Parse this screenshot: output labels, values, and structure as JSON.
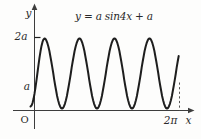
{
  "labels": {
    "title": "y = a sin4x + a",
    "y_axis": "y",
    "x_axis": "x",
    "origin": "O",
    "two_a": "2a",
    "a": "a",
    "two_pi": "2π"
  },
  "colors": {
    "background": "#fdfdfc",
    "curve": "#1e1e1e",
    "axis": "#3d3d3d",
    "text": "#2a2a2a",
    "dashed_guide": "#555555"
  },
  "chart_data": {
    "type": "line",
    "title": "y = a sin4x + a",
    "function": "y = a·sin(4x) + a",
    "amplitude": "a",
    "vertical_shift": "a",
    "period": "π/2",
    "x_range": [
      "0",
      "2π"
    ],
    "y_range": [
      "0",
      "2a"
    ],
    "num_visible_peaks": 4,
    "peaks_x": [
      "π/8",
      "5π/8",
      "9π/8",
      "13π/8"
    ],
    "peak_value": "2a",
    "trough_value": "0",
    "y_axis_marks": [
      "a",
      "2a"
    ],
    "x_axis_marks": [
      "2π"
    ],
    "dashed_guide_at": "x = 2π",
    "grid": false,
    "legend": "none",
    "pixel_curve": {
      "extrema": [
        [
          30.5,
          106.5
        ],
        [
          44.5,
          38.5
        ],
        [
          62,
          108.5
        ],
        [
          79.5,
          38.5
        ],
        [
          97,
          108.5
        ],
        [
          114.5,
          38.5
        ],
        [
          132,
          108.5
        ],
        [
          149.5,
          38.5
        ],
        [
          167,
          108.5
        ],
        [
          184.5,
          38.5
        ]
      ],
      "truncate_x": 179
    }
  }
}
